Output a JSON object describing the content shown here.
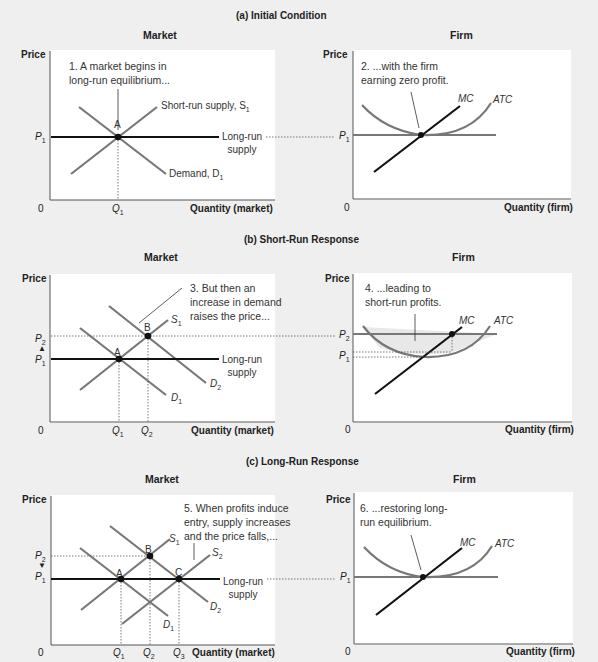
{
  "figure": {
    "panels": [
      {
        "title": "(a) Initial Condition",
        "market": {
          "heading": "Market",
          "y_axis": "Price",
          "x_axis": "Quantity (market)",
          "origin": "0",
          "annotation": [
            "1. A market begins in",
            "long-run equilibrium..."
          ],
          "curves": {
            "supply": "Short-run supply, S",
            "supply_sub": "1",
            "demand": "Demand, D",
            "demand_sub": "1",
            "lr_1": "Long-run",
            "lr_2": "supply"
          },
          "points": [
            "A"
          ],
          "price_ticks": [
            {
              "p": "P",
              "sub": "1"
            }
          ],
          "qty_ticks": [
            {
              "q": "Q",
              "sub": "1"
            }
          ]
        },
        "firm": {
          "heading": "Firm",
          "y_axis": "Price",
          "x_axis": "Quantity (firm)",
          "origin": "0",
          "annotation": [
            "2. ...with the firm",
            "earning zero profit."
          ],
          "curves": {
            "mc": "MC",
            "atc": "ATC"
          },
          "price_ticks": [
            {
              "p": "P",
              "sub": "1"
            }
          ]
        }
      },
      {
        "title": "(b) Short-Run Response",
        "market": {
          "heading": "Market",
          "y_axis": "Price",
          "x_axis": "Quantity (market)",
          "origin": "0",
          "annotation": [
            "3. But then an",
            "increase in demand",
            "raises the price..."
          ],
          "curves": {
            "s1": "S",
            "s1_sub": "1",
            "d1": "D",
            "d1_sub": "1",
            "d2": "D",
            "d2_sub": "2",
            "lr_1": "Long-run",
            "lr_2": "supply"
          },
          "points": [
            "A",
            "B"
          ],
          "price_ticks": [
            {
              "p": "P",
              "sub": "2"
            },
            {
              "p": "P",
              "sub": "1"
            }
          ],
          "qty_ticks": [
            {
              "q": "Q",
              "sub": "1"
            },
            {
              "q": "Q",
              "sub": "2"
            }
          ]
        },
        "firm": {
          "heading": "Firm",
          "y_axis": "Price",
          "x_axis": "Quantity (firm)",
          "origin": "0",
          "annotation": [
            "4. ...leading to",
            "short-run profits."
          ],
          "curves": {
            "mc": "MC",
            "atc": "ATC"
          },
          "price_ticks": [
            {
              "p": "P",
              "sub": "2"
            },
            {
              "p": "P",
              "sub": "1"
            }
          ]
        }
      },
      {
        "title": "(c) Long-Run Response",
        "market": {
          "heading": "Market",
          "y_axis": "Price",
          "x_axis": "Quantity (market)",
          "origin": "0",
          "annotation": [
            "5. When profits induce",
            "entry, supply increases",
            "and the price falls,..."
          ],
          "curves": {
            "s1": "S",
            "s1_sub": "1",
            "s2": "S",
            "s2_sub": "2",
            "d1": "D",
            "d1_sub": "1",
            "d2": "D",
            "d2_sub": "2",
            "lr_1": "Long-run",
            "lr_2": "supply"
          },
          "points": [
            "A",
            "B",
            "C"
          ],
          "price_ticks": [
            {
              "p": "P",
              "sub": "2"
            },
            {
              "p": "P",
              "sub": "1"
            }
          ],
          "qty_ticks": [
            {
              "q": "Q",
              "sub": "1"
            },
            {
              "q": "Q",
              "sub": "2"
            },
            {
              "q": "Q",
              "sub": "3"
            }
          ]
        },
        "firm": {
          "heading": "Firm",
          "y_axis": "Price",
          "x_axis": "Quantity (firm)",
          "origin": "0",
          "annotation": [
            "6. ...restoring long-",
            "run equilibrium."
          ],
          "curves": {
            "mc": "MC",
            "atc": "ATC"
          },
          "price_ticks": [
            {
              "p": "P",
              "sub": "1"
            }
          ]
        }
      }
    ],
    "colors": {
      "background": "#efefef",
      "plot": "#ffffff",
      "curve_gray": "#767676",
      "curve_black": "#111111"
    }
  }
}
